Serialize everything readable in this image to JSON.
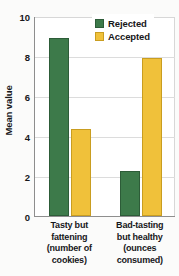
{
  "chart_data": {
    "type": "bar",
    "title": "",
    "subtitle": "",
    "xlabel": "",
    "ylabel": "Mean value",
    "ylim": [
      0,
      10
    ],
    "yticks": [
      0,
      2,
      4,
      6,
      8,
      10
    ],
    "ytick_labels": [
      "0",
      "2",
      "4",
      "6",
      "8",
      "10"
    ],
    "grid": true,
    "grid_axis": "y",
    "legend_position": "top-right",
    "categories": [
      "Tasty but fattening (number of cookies)",
      "Bad-tasting but healthy (ounces consumed)"
    ],
    "category_label_lines": [
      [
        "Tasty but",
        "fattening",
        "(number of",
        "cookies)"
      ],
      [
        "Bad-tasting",
        "but healthy",
        "(ounces",
        "consumed)"
      ]
    ],
    "series": [
      {
        "name": "Rejected",
        "color": "#3d7a4a",
        "values": [
          8.9,
          2.25
        ]
      },
      {
        "name": "Accepted",
        "color": "#f0c13a",
        "values": [
          4.35,
          7.9
        ]
      }
    ]
  },
  "legend": {
    "items": [
      {
        "label": "Rejected",
        "swatch": "rejected"
      },
      {
        "label": "Accepted",
        "swatch": "accepted"
      }
    ]
  },
  "colors": {
    "rejected": "#3d7a4a",
    "rejected_edge": "#2d5c38",
    "accepted": "#f0c13a",
    "accepted_edge": "#c99d20",
    "axis": "#8e8e8e",
    "grid": "#dcdcdc",
    "text": "#17171a",
    "plot_background": "#ffffff",
    "figure_background": "#fbfbfa"
  }
}
